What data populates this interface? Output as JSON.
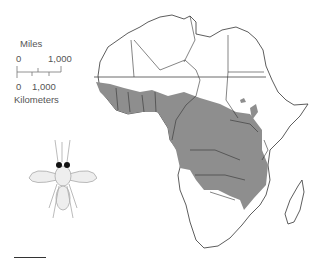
{
  "scale": {
    "miles_label": "Miles",
    "miles_ticks": [
      "0",
      "1,000"
    ],
    "km_ticks": [
      "0",
      "1,000"
    ],
    "km_label": "Kilometers"
  },
  "map": {
    "subject": "Africa - tsetse fly distribution",
    "range_color": "#8e8e8e",
    "border_color": "#333333"
  },
  "illustration": "tsetse-fly"
}
